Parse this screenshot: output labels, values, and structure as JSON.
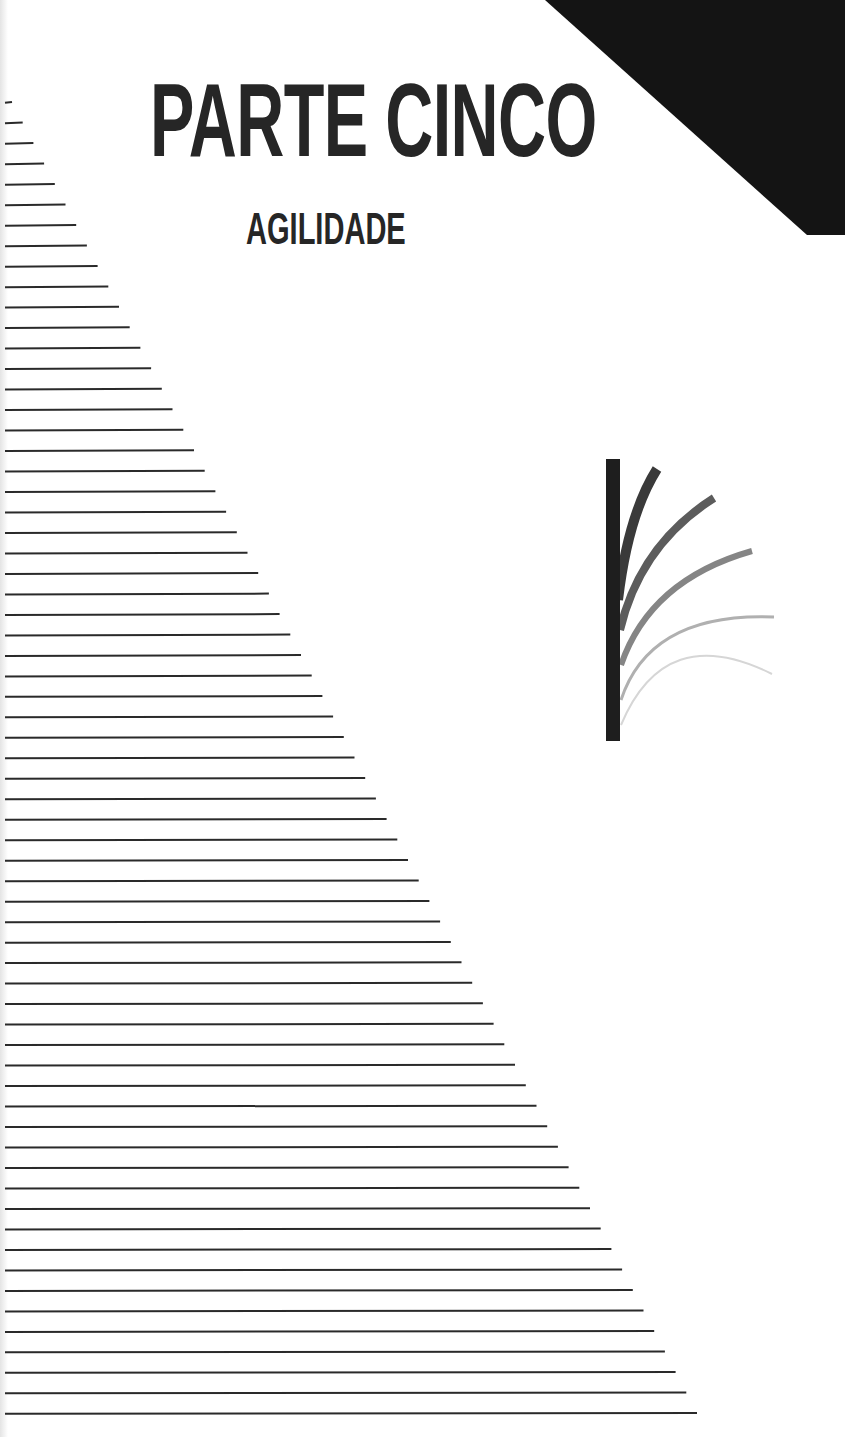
{
  "page": {
    "title": "PARTE CINCO",
    "subtitle": "AGILIDADE",
    "text_color": "#262626",
    "background_color": "#ffffff"
  },
  "corner_triangle": {
    "icon": "black-corner-triangle",
    "color": "#141414",
    "points": [
      [
        545,
        0
      ],
      [
        845,
        0
      ],
      [
        845,
        235
      ],
      [
        807,
        235
      ]
    ]
  },
  "striped_lines": {
    "icon": "horizontal-lines-triangle",
    "count": 65,
    "start_x": 5,
    "first_y": 102,
    "last_y": 1413,
    "first_end_x": 12,
    "last_end_x": 697,
    "stroke_width": 2,
    "color": "#2a2a2a"
  },
  "agility_graphic": {
    "icon": "bending-reeds-icon",
    "bar": {
      "x": 606,
      "y": 459,
      "width": 14,
      "height": 282,
      "color": "#1e1e1e"
    },
    "curves": [
      {
        "from": [
          618,
          600
        ],
        "ctrl": [
          628,
          515
        ],
        "to": [
          657,
          469
        ],
        "width": 10,
        "color": "#3a3a3a"
      },
      {
        "from": [
          620,
          630
        ],
        "ctrl": [
          640,
          545
        ],
        "to": [
          714,
          498
        ],
        "width": 8,
        "color": "#5c5c5c"
      },
      {
        "from": [
          621,
          665
        ],
        "ctrl": [
          650,
          580
        ],
        "to": [
          752,
          551
        ],
        "width": 6,
        "color": "#858585"
      },
      {
        "from": [
          621,
          700
        ],
        "ctrl": [
          650,
          612
        ],
        "to": [
          774,
          617
        ],
        "width": 3,
        "color": "#b0b0b0"
      },
      {
        "from": [
          621,
          725
        ],
        "ctrl": [
          665,
          620
        ],
        "to": [
          772,
          674
        ],
        "width": 2,
        "color": "#d6d6d6"
      }
    ]
  }
}
